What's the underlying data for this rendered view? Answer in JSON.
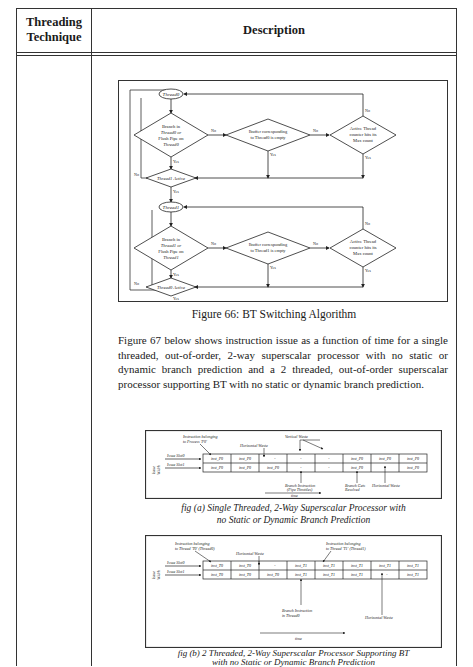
{
  "table": {
    "headers": [
      "Threading Technique",
      "Description"
    ],
    "header_lines": {
      "col1": [
        "Threading",
        "Technique"
      ],
      "col2": "Description"
    }
  },
  "figure66": {
    "caption": "Figure 66: BT Switching Algorithm",
    "blocks": [
      {
        "thread_node": "Thread0",
        "decision1": [
          "Branch in",
          "Thread0 or",
          "Flush Pipe on",
          "Thread0"
        ],
        "decision2": [
          "Ibuffer corresponding",
          "to Thread0 is empty"
        ],
        "decision3": [
          "Active Thread",
          "counter hits its",
          "Max count"
        ],
        "active_check": "Thread1 Active"
      },
      {
        "thread_node": "Thread1",
        "decision1": [
          "Branch in",
          "Thread1 or",
          "Flush Pipe on",
          "Thread1"
        ],
        "decision2": [
          "Ibuffer corresponding",
          "to Thread1 is empty"
        ],
        "decision3": [
          "Active Thread",
          "counter hits its",
          "Max count"
        ],
        "active_check": "Thread0 Active"
      }
    ],
    "labels": {
      "yes": "Yes",
      "no": "No"
    }
  },
  "paragraph": "Figure 67 below shows instruction issue as a function of time for a single threaded, out-of-order, 2-way superscalar processor with no static or dynamic branch prediction and a 2 threaded, out-of-order superscalar processor supporting BT with no static or dynamic branch prediction.",
  "fig_a": {
    "caption_lines": [
      "fig (a) Single Threaded, 2-Way Superscalar Processor with",
      "no Static or Dynamic Branch Prediction"
    ],
    "side_label": [
      "Issue",
      "Width"
    ],
    "slot_labels": [
      "Issue Slot0",
      "Issue Slot1"
    ],
    "rows": [
      [
        "inst_P0",
        "inst_P0",
        "-",
        "-",
        "-",
        "inst_P0",
        "inst_P0",
        "inst_P0"
      ],
      [
        "inst_P0",
        "inst_P0",
        "inst_P0",
        "-",
        "-",
        "inst_P0",
        "-",
        "inst_P0"
      ]
    ],
    "annotations": {
      "instr_belonging": [
        "Instruction belonging",
        "to Process 'P0'"
      ],
      "vertical_waste": "Vertical Waste",
      "horizontal_waste_top": "Horizontal Waste",
      "branch_instruction": [
        "Branch Instruction",
        "(Pipe Throttles)"
      ],
      "branch_resolved": [
        "Branch Gets",
        "Resolved"
      ],
      "horizontal_waste_bottom": "Horizontal Waste",
      "time": "time"
    }
  },
  "fig_b": {
    "caption_lines": [
      "fig (b) 2 Threaded, 2-Way Superscalar Processor Supporting BT",
      "with no Static or Dynamic Branch Prediction"
    ],
    "side_label": [
      "Issue",
      "Width"
    ],
    "slot_labels": [
      "Issue Slot0",
      "Issue Slot1"
    ],
    "rows": [
      [
        "inst_T0",
        "inst_T0",
        "-",
        "inst_T1",
        "inst_T1",
        "inst_T1",
        "inst_T1",
        "inst_T1"
      ],
      [
        "inst_T0",
        "inst_T0",
        "inst_T0",
        "inst_T1",
        "inst_T1",
        "inst_T1",
        "-",
        "inst_T1"
      ]
    ],
    "annotations": {
      "instr_t0": [
        "Instruction belonging",
        "to Thread 'T0' (Thread0)"
      ],
      "horizontal_waste_top": "Horizontal Waste",
      "instr_t1": [
        "Instruction belonging",
        "to Thread 'T1' (Thread1)"
      ],
      "branch_instruction": [
        "Branch Instruction",
        "in Thread0"
      ],
      "horizontal_waste_bottom": "Horizontal Waste",
      "time": "time"
    }
  }
}
